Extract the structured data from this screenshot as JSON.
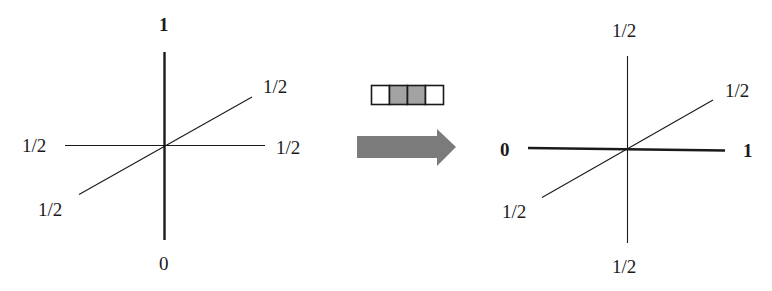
{
  "colors": {
    "line": "#1a1a1a",
    "arrow": "#7b7b7b",
    "cell_filled": "#a3a3a3",
    "cell_empty": "#ffffff",
    "cell_border": "#1a1a1a"
  },
  "left_diagram": {
    "labels": {
      "top": "1",
      "bottom": "0",
      "left": "1/2",
      "right": "1/2",
      "diag_upper_right": "1/2",
      "diag_lower_left": "1/2"
    },
    "bold_axis": "vertical"
  },
  "transition": {
    "cells": [
      {
        "filled": false
      },
      {
        "filled": true
      },
      {
        "filled": true
      },
      {
        "filled": false
      }
    ],
    "arrow_direction": "right"
  },
  "right_diagram": {
    "labels": {
      "top": "1/2",
      "bottom": "1/2",
      "left": "0",
      "right": "1",
      "diag_upper_right": "1/2",
      "diag_lower_left": "1/2"
    },
    "bold_axis": "horizontal"
  }
}
